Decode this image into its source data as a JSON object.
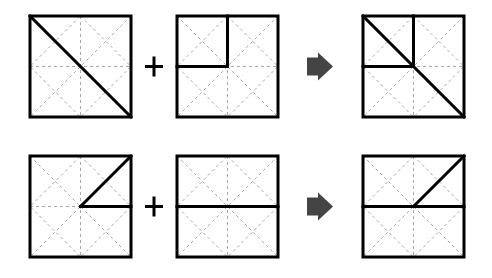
{
  "colors": {
    "background": "#ffffff",
    "stroke": "#000000",
    "grid": "#a8a8a8",
    "arrow": "#444444"
  },
  "layout": {
    "square_size": 101,
    "rows_y": [
      16,
      156
    ],
    "cols_x": [
      30,
      177,
      363
    ],
    "plus_x": 154,
    "arrow_x": 307
  },
  "rows": [
    {
      "operand_a": {
        "lines": [
          [
            0,
            0,
            1,
            1
          ]
        ]
      },
      "operator": "+",
      "operand_b": {
        "lines": [
          [
            0.5,
            0,
            0.5,
            0.5
          ],
          [
            0,
            0.5,
            0.5,
            0.5
          ]
        ]
      },
      "result_arrow": "right-arrow",
      "result": {
        "lines": [
          [
            0,
            0,
            1,
            1
          ],
          [
            0.5,
            0,
            0.5,
            0.5
          ],
          [
            0,
            0.5,
            0.5,
            0.5
          ]
        ]
      }
    },
    {
      "operand_a": {
        "lines": [
          [
            0.5,
            0.5,
            1,
            0
          ],
          [
            0.5,
            0.5,
            1,
            0.5
          ]
        ]
      },
      "operator": "+",
      "operand_b": {
        "lines": [
          [
            0,
            0.5,
            1,
            0.5
          ]
        ]
      },
      "result_arrow": "right-arrow",
      "result": {
        "lines": [
          [
            0.5,
            0.5,
            1,
            0
          ],
          [
            0,
            0.5,
            1,
            0.5
          ]
        ]
      }
    }
  ]
}
